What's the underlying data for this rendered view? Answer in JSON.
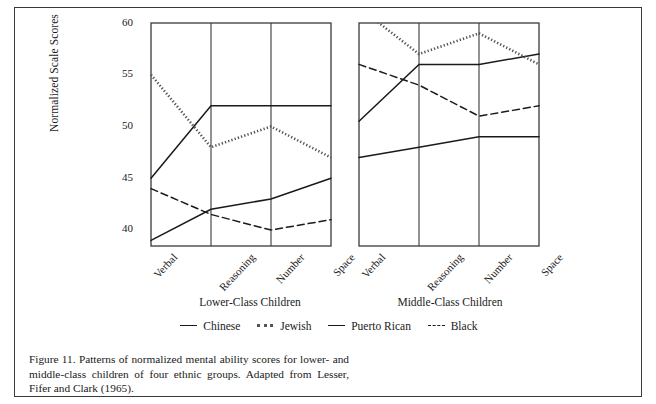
{
  "figure": {
    "caption": "Figure 11.   Patterns of normalized mental ability scores for lower- and middle-class children of four ethnic groups. Adapted from Lesser, Fifer and Clark (1965)."
  },
  "axis": {
    "ylabel": "Normalized Scale Scores",
    "yticks": [
      "60",
      "55",
      "50",
      "45",
      "40"
    ],
    "xticks": [
      "Verbal",
      "Reasoning",
      "Number",
      "Space"
    ]
  },
  "panels": [
    {
      "title": "Lower-Class Children"
    },
    {
      "title": "Middle-Class Children"
    }
  ],
  "legend": [
    {
      "label": "Chinese",
      "style": "solid",
      "color": "#1a1a1a"
    },
    {
      "label": "Jewish",
      "style": "dotted",
      "color": "#555555"
    },
    {
      "label": "Puerto Rican",
      "style": "solid",
      "color": "#1a1a1a"
    },
    {
      "label": "Black",
      "style": "dashed",
      "color": "#1a1a1a"
    }
  ],
  "chart_data": {
    "type": "line",
    "title": "Patterns of normalized mental ability scores",
    "xlabel": "",
    "ylabel": "Normalized Scale Scores",
    "ylim": [
      38,
      60
    ],
    "yticks": [
      40,
      45,
      50,
      55,
      60
    ],
    "grid": "vertical-category-lines",
    "legend_position": "bottom-center",
    "categories": [
      "Verbal",
      "Reasoning",
      "Number",
      "Space"
    ],
    "panels": [
      {
        "name": "Lower-Class Children",
        "series": [
          {
            "name": "Chinese",
            "style": "solid",
            "values": [
              45.0,
              52.0,
              52.0,
              52.0
            ]
          },
          {
            "name": "Jewish",
            "style": "dotted",
            "values": [
              55.0,
              48.0,
              50.0,
              47.0
            ]
          },
          {
            "name": "Puerto Rican",
            "style": "solid",
            "values": [
              39.0,
              42.0,
              43.0,
              45.0
            ]
          },
          {
            "name": "Black",
            "style": "dashed",
            "values": [
              44.0,
              41.5,
              40.0,
              41.0
            ]
          }
        ]
      },
      {
        "name": "Middle-Class Children",
        "series": [
          {
            "name": "Chinese",
            "style": "solid",
            "values": [
              50.5,
              56.0,
              56.0,
              57.0
            ]
          },
          {
            "name": "Jewish",
            "style": "dotted",
            "values": [
              61.5,
              57.0,
              59.0,
              56.0
            ]
          },
          {
            "name": "Puerto Rican",
            "style": "solid",
            "values": [
              47.0,
              48.0,
              49.0,
              49.0
            ]
          },
          {
            "name": "Black",
            "style": "dashed",
            "values": [
              56.0,
              54.0,
              51.0,
              52.0
            ]
          }
        ]
      }
    ]
  }
}
